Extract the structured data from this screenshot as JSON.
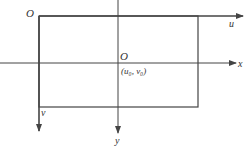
{
  "diagram": {
    "labels": {
      "origin_uv": "O",
      "origin_xy": "O",
      "u_axis": "u",
      "v_axis": "v",
      "x_axis": "x",
      "y_axis": "y",
      "principal_point": "(u₀, v₀)"
    },
    "colors": {
      "line": "#444444",
      "text": "#333333"
    }
  }
}
